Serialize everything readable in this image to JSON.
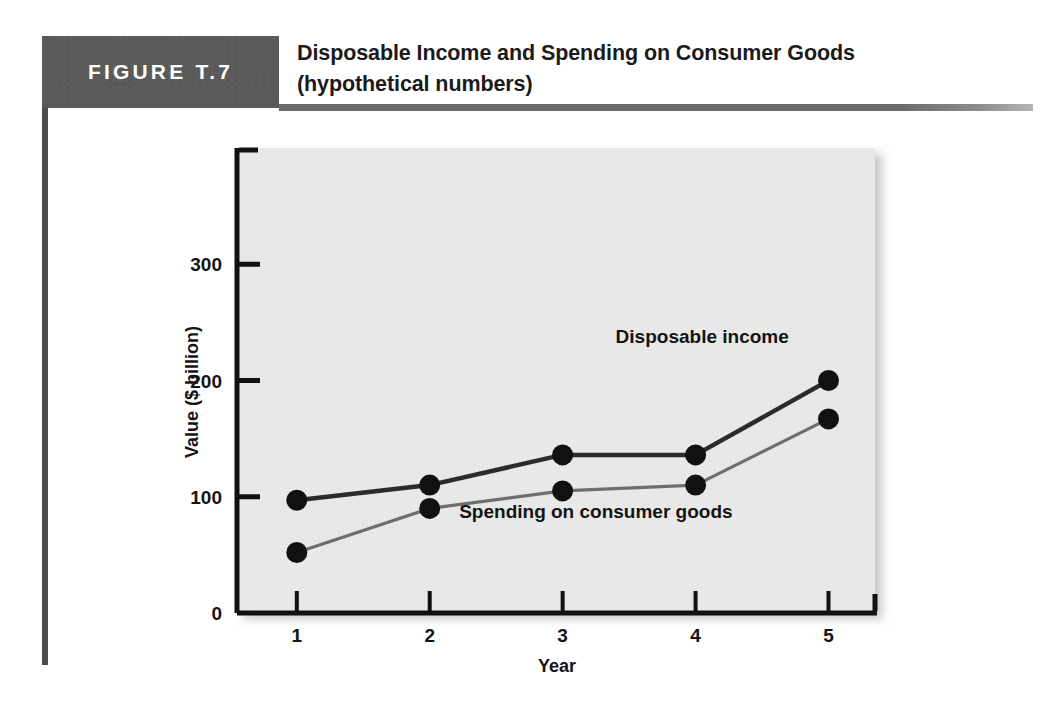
{
  "figure": {
    "badge_label": "FIGURE T.7",
    "title_line1": "Disposable Income and Spending on Consumer Goods",
    "title_line2": "(hypothetical numbers)"
  },
  "colors": {
    "badge_background": "#5a5a5a",
    "rule": "#6b6b6b",
    "plot_background": "#e8e8e8",
    "axis": "#111111",
    "series_disposable_income": "#2b2b2b",
    "series_spending": "#6e6e6e",
    "marker": "#111111",
    "text": "#141414"
  },
  "chart_data": {
    "type": "line",
    "title": "Disposable Income and Spending on Consumer Goods (hypothetical numbers)",
    "xlabel": "Year",
    "ylabel": "Value ($ billion)",
    "categories": [
      "1",
      "2",
      "3",
      "4",
      "5"
    ],
    "x": [
      1,
      2,
      3,
      4,
      5
    ],
    "xlim": [
      0.55,
      5.35
    ],
    "ylim": [
      0,
      400
    ],
    "yticks": [
      0,
      100,
      200,
      300
    ],
    "ytick_labels": [
      "0",
      "100",
      "200",
      "300"
    ],
    "xtick_labels": [
      "1",
      "2",
      "3",
      "4",
      "5"
    ],
    "grid": false,
    "legend": "inline-annotations",
    "series": [
      {
        "name": "Disposable income",
        "label": "Disposable income",
        "values": [
          97,
          110,
          136,
          136,
          200
        ],
        "color": "#2b2b2b",
        "label_x": 4.05,
        "label_y": 232
      },
      {
        "name": "Spending on consumer goods",
        "label": "Spending on consumer goods",
        "values": [
          52,
          90,
          105,
          110,
          167
        ],
        "color": "#6e6e6e",
        "label_x": 3.25,
        "label_y": 82
      }
    ]
  }
}
